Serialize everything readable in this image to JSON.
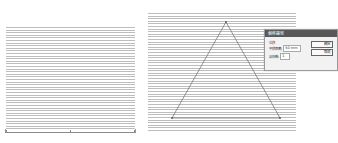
{
  "panels": {
    "left": {
      "description": "horizontal line hatch fill"
    },
    "right": {
      "description": "horizontal line hatch fill with triangle path",
      "triangle": {
        "apex": [
          78,
          9
        ],
        "base_left": [
          24,
          105
        ],
        "base_right": [
          132,
          105
        ],
        "stroke": "#777777"
      }
    }
  },
  "dialog": {
    "title": "偏移路径",
    "group_label": "位移",
    "fields": [
      {
        "label": "平移距离:",
        "value": "50 mm"
      },
      {
        "label": "副本数:",
        "value": "1"
      }
    ],
    "buttons": {
      "ok": "确定",
      "cancel": "取消"
    }
  },
  "colors": {
    "hatch_line": "#bdbdbd",
    "dialog_title_bg": "#585858",
    "dialog_bg": "#f2f2f2"
  }
}
